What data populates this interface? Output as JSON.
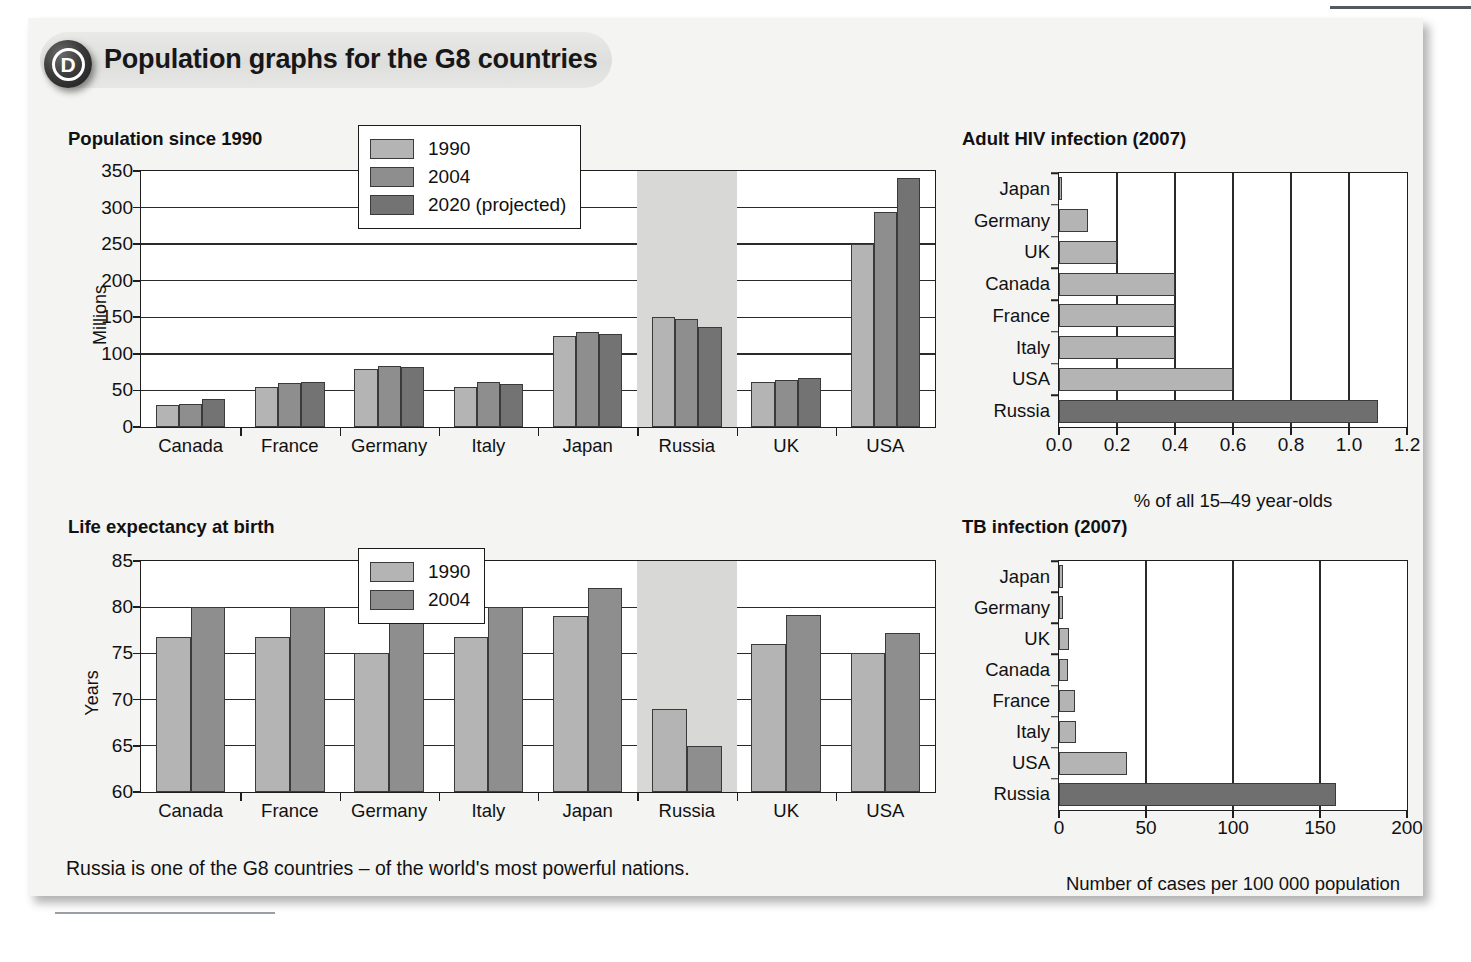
{
  "header": {
    "badge": "D",
    "title": "Population graphs for the G8 countries"
  },
  "caption": "Russia is one of the G8 countries – of the world's most powerful nations.",
  "sections": {
    "population_title": "Population since 1990",
    "life_title": "Life expectancy at birth",
    "hiv_title": "Adult HIV infection (2007)",
    "tb_title": "TB infection (2007)"
  },
  "colors": {
    "series_1990": "#b4b4b4",
    "series_2004": "#8e8e8e",
    "series_2020": "#737373",
    "highlight_band": "#d8d8d6",
    "panel_bg": "#f4f4f2",
    "plot_bg": "#ffffff",
    "axis": "#1e1e1e"
  },
  "chart_data": [
    {
      "id": "population",
      "type": "bar",
      "title": "Population since 1990",
      "xlabel": "",
      "ylabel": "Millions",
      "ylim": [
        0,
        350
      ],
      "yticks": [
        0,
        50,
        100,
        150,
        200,
        250,
        300,
        350
      ],
      "grid": true,
      "legend_position": "top-center",
      "highlight_category": "Russia",
      "categories": [
        "Canada",
        "France",
        "Germany",
        "Italy",
        "Japan",
        "Russia",
        "UK",
        "USA"
      ],
      "series": [
        {
          "name": "1990",
          "values": [
            30,
            55,
            79,
            55,
            124,
            151,
            61,
            250
          ]
        },
        {
          "name": "2004",
          "values": [
            31,
            60,
            83,
            62,
            130,
            148,
            64,
            294
          ]
        },
        {
          "name": "2020 (projected)",
          "values": [
            38,
            62,
            82,
            59,
            127,
            137,
            67,
            340
          ]
        }
      ]
    },
    {
      "id": "life-expectancy",
      "type": "bar",
      "title": "Life expectancy at birth",
      "xlabel": "",
      "ylabel": "Years",
      "ylim": [
        60,
        85
      ],
      "yticks": [
        60,
        65,
        70,
        75,
        80,
        85
      ],
      "grid": true,
      "legend_position": "top-center",
      "highlight_category": "Russia",
      "categories": [
        "Canada",
        "France",
        "Germany",
        "Italy",
        "Japan",
        "Russia",
        "UK",
        "USA"
      ],
      "series": [
        {
          "name": "1990",
          "values": [
            76.8,
            76.8,
            75.0,
            76.8,
            79.0,
            69.0,
            76.0,
            75.0
          ]
        },
        {
          "name": "2004",
          "values": [
            80.0,
            80.0,
            78.3,
            80.0,
            82.1,
            65.0,
            79.2,
            77.2
          ]
        }
      ]
    },
    {
      "id": "hiv",
      "type": "bar",
      "orientation": "horizontal",
      "title": "Adult HIV infection (2007)",
      "xlabel": "% of all 15–49 year-olds",
      "ylabel": "",
      "xlim": [
        0,
        1.2
      ],
      "xticks": [
        "0.0",
        "0.2",
        "0.4",
        "0.6",
        "0.8",
        "1.0",
        "1.2"
      ],
      "grid": true,
      "categories": [
        "Japan",
        "Germany",
        "UK",
        "Canada",
        "France",
        "Italy",
        "USA",
        "Russia"
      ],
      "values": [
        0.01,
        0.1,
        0.2,
        0.4,
        0.4,
        0.4,
        0.6,
        1.1
      ],
      "highlight_category": "Russia"
    },
    {
      "id": "tb",
      "type": "bar",
      "orientation": "horizontal",
      "title": "TB infection (2007)",
      "xlabel": "Number of cases per 100 000 population",
      "ylabel": "",
      "xlim": [
        0,
        200
      ],
      "xticks": [
        "0",
        "50",
        "100",
        "150",
        "200"
      ],
      "grid": true,
      "categories": [
        "Japan",
        "Germany",
        "UK",
        "Canada",
        "France",
        "Italy",
        "USA",
        "Russia"
      ],
      "values": [
        2.5,
        2.5,
        6,
        5,
        9,
        10,
        39,
        159
      ],
      "highlight_category": "Russia"
    }
  ]
}
